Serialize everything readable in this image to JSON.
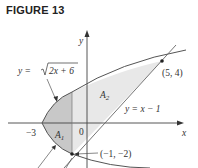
{
  "figure": {
    "title": "FIGURE 13",
    "curve1_label": "y = √(2x + 6)",
    "curve1_prefix": "y = ",
    "curve1_radicand": "2x + 6",
    "line_label": "y = x − 1",
    "point1_label": "(5, 4)",
    "point2_label": "(−1, −2)",
    "region1_label": "A",
    "region1_sub": "1",
    "region2_label": "A",
    "region2_sub": "2",
    "x_axis_label": "x",
    "y_axis_label": "y",
    "origin_label": "0",
    "tick_neg3_label": "−3",
    "colors": {
      "region1_fill": "#c8c8c8",
      "region2_fill": "#e6e6e6",
      "curve": "#555555",
      "axis": "#444444"
    }
  }
}
